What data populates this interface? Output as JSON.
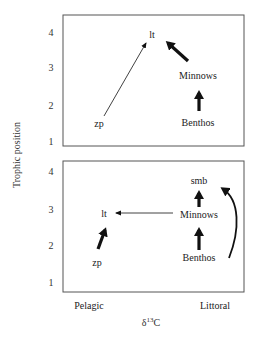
{
  "figure": {
    "y_axis_label": "Trophic position",
    "x_axis_label_prefix": "δ",
    "x_axis_label_sup": "13",
    "x_axis_label_suffix": "C",
    "x_axis_ends": {
      "left": "Pelagic",
      "right": "Littoral"
    },
    "colors": {
      "frame": "#555555",
      "arrow": "#111111",
      "text": "#222222"
    }
  },
  "top_panel": {
    "ticks": [
      "4",
      "3",
      "2",
      "1"
    ],
    "nodes": {
      "lt": "lt",
      "minnows": "Minnows",
      "benthos": "Benthos",
      "zp": "zp"
    },
    "arrows": [
      {
        "from": "zp",
        "to": "lt",
        "style": "thin"
      },
      {
        "from": "Minnows",
        "to": "lt",
        "style": "thick"
      },
      {
        "from": "Benthos",
        "to": "Minnows",
        "style": "thick"
      }
    ]
  },
  "bottom_panel": {
    "ticks": [
      "4",
      "3",
      "2",
      "1"
    ],
    "nodes": {
      "smb": "smb",
      "lt": "lt",
      "minnows": "Minnows",
      "benthos": "Benthos",
      "zp": "zp"
    },
    "arrows": [
      {
        "from": "zp",
        "to": "lt",
        "style": "thick"
      },
      {
        "from": "Minnows",
        "to": "lt",
        "style": "thin"
      },
      {
        "from": "Minnows",
        "to": "smb",
        "style": "thick"
      },
      {
        "from": "Benthos",
        "to": "Minnows",
        "style": "thick"
      },
      {
        "from": "Benthos",
        "to": "smb",
        "style": "curved"
      }
    ]
  }
}
